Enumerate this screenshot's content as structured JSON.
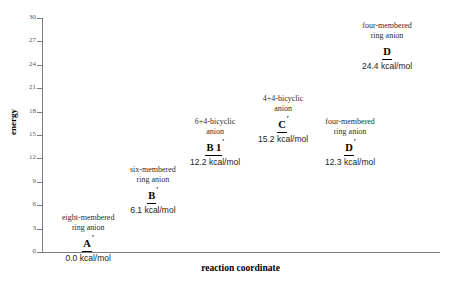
{
  "chart_data": {
    "type": "scatter",
    "title": "",
    "xlabel": "reaction coordinate",
    "ylabel": "energy",
    "ylim": [
      0,
      30
    ],
    "yticks": [
      0,
      3,
      6,
      9,
      12,
      15,
      18,
      21,
      24,
      27,
      30
    ],
    "xticks": [],
    "grid": false,
    "legend": false,
    "units": "kcal/mol",
    "categories": [
      "eight-membered ring anion",
      "six-membered ring anion",
      "6+4-bicyclic anion",
      "4+4-bicyclic anion",
      "four-membered ring anion",
      "four-membered ring anion"
    ],
    "values": [
      0.0,
      6.1,
      12.2,
      15.2,
      12.3,
      24.4
    ],
    "point_labels": [
      "A′",
      "B′",
      "B 1′",
      "C′",
      "D′",
      "D"
    ]
  },
  "axes": {
    "y_title": "energy",
    "x_title": "reaction coordinate",
    "y_ticks": [
      {
        "label": "30",
        "value": 30
      },
      {
        "label": "27",
        "value": 27
      },
      {
        "label": "24",
        "value": 24
      },
      {
        "label": "21",
        "value": 21
      },
      {
        "label": "18",
        "value": 18
      },
      {
        "label": "15",
        "value": 15
      },
      {
        "label": "12",
        "value": 12
      },
      {
        "label": "9",
        "value": 9
      },
      {
        "label": "6",
        "value": 6
      },
      {
        "label": "3",
        "value": 3
      },
      {
        "label": "0",
        "value": 0
      }
    ]
  },
  "points": [
    {
      "id": "a",
      "name_line1": "eight-membered",
      "name_line2": "ring anion",
      "marker_letter": "A",
      "marker_prime": "′",
      "value_label": "0.0 kcal/mol",
      "energy": 0.0,
      "left": 62,
      "marker_top": 236
    },
    {
      "id": "b",
      "name_line1": "six-membered",
      "name_line2": "ring anion",
      "marker_letter": "B",
      "marker_prime": "′",
      "value_label": "6.1 kcal/mol",
      "energy": 6.1,
      "left": 130,
      "marker_top": 188
    },
    {
      "id": "b1",
      "name_line1": "6+4-bicyclic",
      "name_line2": "anion",
      "marker_letter": "B 1",
      "marker_prime": "′",
      "value_label": "12.2 kcal/mol",
      "energy": 12.2,
      "left": 190,
      "marker_top": 140
    },
    {
      "id": "c",
      "name_line1": "4+4-bicyclic",
      "name_line2": "anion",
      "marker_letter": "C",
      "marker_prime": "′",
      "value_label": "15.2 kcal/mol",
      "energy": 15.2,
      "left": 258,
      "marker_top": 117
    },
    {
      "id": "d-prime",
      "name_line1": "four-membered",
      "name_line2": "ring anion",
      "marker_letter": "D",
      "marker_prime": "′",
      "value_label": "12.3 kcal/mol",
      "energy": 12.3,
      "left": 325,
      "marker_top": 140
    },
    {
      "id": "d",
      "name_line1": "four-membered",
      "name_line2": "ring anion",
      "marker_letter": "D",
      "marker_prime": "",
      "value_label": "24.4 kcal/mol",
      "energy": 24.4,
      "left": 362,
      "marker_top": 44
    }
  ]
}
